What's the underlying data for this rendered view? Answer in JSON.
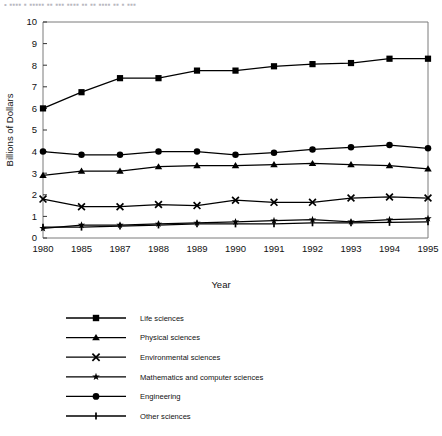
{
  "top_partial_text": "•  ▪▪▪▪  ▪ ▪▪▪▪▪  ▪▪  ▪▪▪  ▪▪▪▪  ▪▪  ▪▪  ▪▪▪▪  ▪▪  ▪  ▪▪▪",
  "chart_data": {
    "type": "line",
    "title": "",
    "xlabel": "Year",
    "ylabel": "Billions of Dollars",
    "x": [
      "1980",
      "1985",
      "1987",
      "1988",
      "1989",
      "1990",
      "1991",
      "1992",
      "1993",
      "1994",
      "1995"
    ],
    "xtick_labels": [
      "1980",
      "1985",
      "1987",
      "1988",
      "1989",
      "1990",
      "1991",
      "1992",
      "1993",
      "1994",
      "1995"
    ],
    "ytick_labels": [
      "0",
      "1",
      "2",
      "3",
      "4",
      "5",
      "6",
      "7",
      "8",
      "9",
      "10"
    ],
    "ylim": [
      0,
      10
    ],
    "ytick_step": 1,
    "grid": false,
    "legend_position": "below",
    "series": [
      {
        "name": "Life sciences",
        "marker": "square",
        "values": [
          6.0,
          6.75,
          7.4,
          7.4,
          7.75,
          7.75,
          7.95,
          8.05,
          8.1,
          8.3,
          8.3
        ]
      },
      {
        "name": "Physical sciences",
        "marker": "triangle",
        "values": [
          2.9,
          3.1,
          3.1,
          3.3,
          3.35,
          3.35,
          3.4,
          3.45,
          3.4,
          3.35,
          3.2
        ]
      },
      {
        "name": "Environmental sciences",
        "marker": "x",
        "values": [
          1.8,
          1.45,
          1.45,
          1.55,
          1.5,
          1.75,
          1.65,
          1.65,
          1.85,
          1.9,
          1.85
        ]
      },
      {
        "name": "Mathematics and computer sciences",
        "marker": "star",
        "values": [
          0.45,
          0.6,
          0.6,
          0.65,
          0.7,
          0.75,
          0.8,
          0.85,
          0.75,
          0.85,
          0.9
        ]
      },
      {
        "name": "Engineering",
        "marker": "circle",
        "values": [
          4.0,
          3.85,
          3.85,
          4.0,
          4.0,
          3.85,
          3.95,
          4.1,
          4.2,
          4.3,
          4.15
        ]
      },
      {
        "name": "Other sciences",
        "marker": "plus",
        "values": [
          0.5,
          0.5,
          0.55,
          0.6,
          0.65,
          0.65,
          0.65,
          0.7,
          0.7,
          0.72,
          0.75
        ]
      }
    ]
  },
  "legend": {
    "entries": [
      {
        "label": "Life sciences",
        "marker": "square"
      },
      {
        "label": "Physical sciences",
        "marker": "triangle"
      },
      {
        "label": "Environmental sciences",
        "marker": "x"
      },
      {
        "label": "Mathematics and computer sciences",
        "marker": "star"
      },
      {
        "label": "Engineering",
        "marker": "circle"
      },
      {
        "label": "Other sciences",
        "marker": "plus"
      }
    ]
  },
  "colors": {
    "ink": "#000000",
    "axis": "#7a7a7a",
    "background": "#ffffff"
  }
}
